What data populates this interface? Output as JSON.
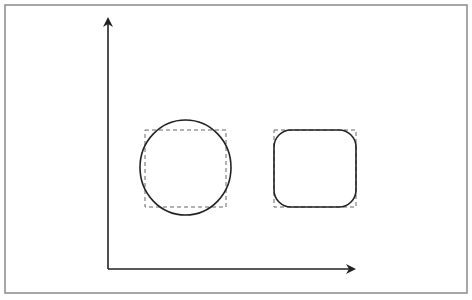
{
  "diagram": {
    "type": "shape-bounding-box-illustration",
    "colors": {
      "background": "#ffffff",
      "border": "#8a8a8a",
      "stroke": "#222222",
      "dashed": "#666666"
    },
    "border": {
      "x": 5,
      "y": 5,
      "width": 462,
      "height": 288
    },
    "axes": {
      "origin": {
        "x": 108,
        "y": 269
      },
      "y_axis_tip": {
        "x": 108,
        "y": 19
      },
      "x_axis_tip": {
        "x": 354,
        "y": 269
      }
    },
    "shapes": [
      {
        "kind": "circle",
        "cx": 185.5,
        "cy": 167.5,
        "rx": 45.5,
        "ry": 47.5,
        "bounding_box": {
          "x": 145,
          "y": 130,
          "width": 81,
          "height": 77,
          "style": "dashed"
        }
      },
      {
        "kind": "rounded-rectangle",
        "x": 274,
        "y": 130,
        "width": 82,
        "height": 77,
        "corner_radius": 17,
        "bounding_box": {
          "x": 274,
          "y": 130,
          "width": 82,
          "height": 77,
          "style": "dashed"
        }
      }
    ]
  }
}
